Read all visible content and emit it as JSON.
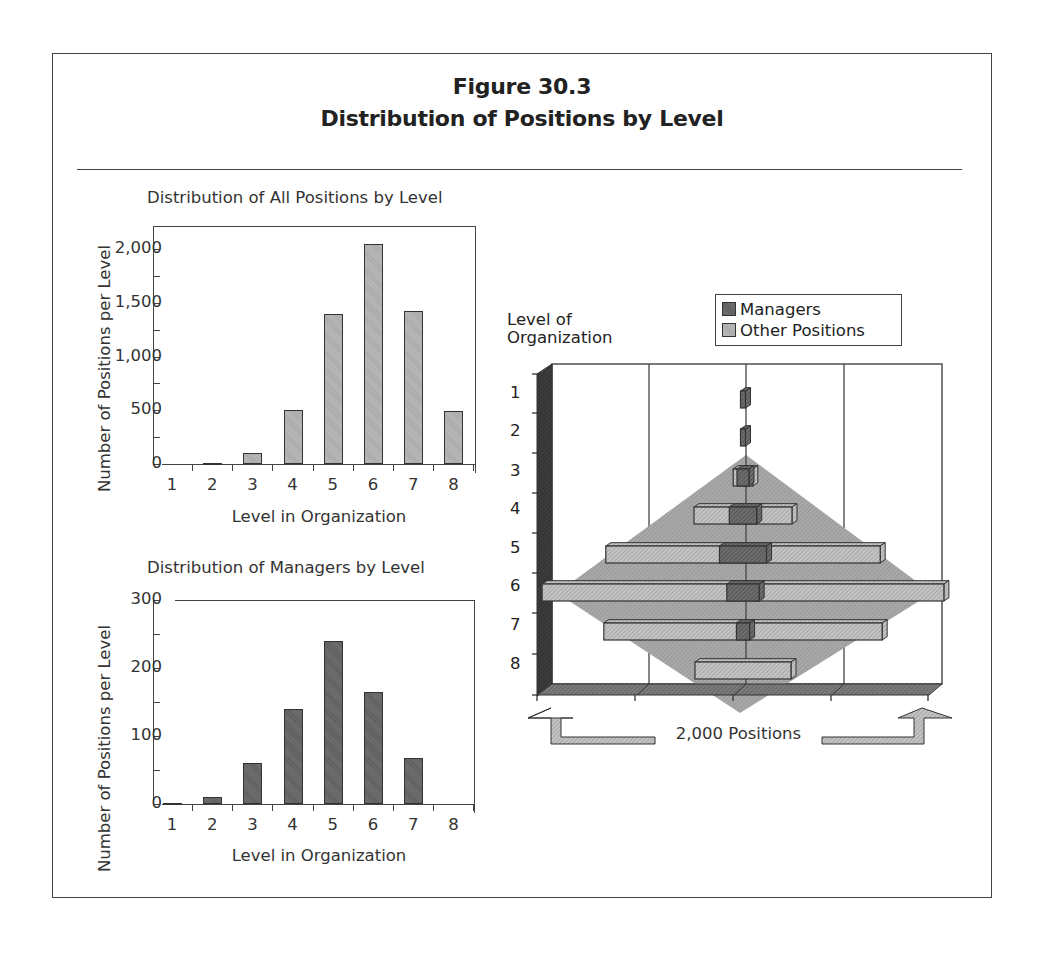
{
  "figure": {
    "number": "Figure 30.3",
    "title": "Distribution of Positions by Level"
  },
  "chart_data": [
    {
      "type": "bar",
      "title": "Distribution of All Positions by Level",
      "xlabel": "Level in Organization",
      "ylabel": "Number of Positions per Level",
      "categories": [
        "1",
        "2",
        "3",
        "4",
        "5",
        "6",
        "7",
        "8"
      ],
      "values": [
        0,
        10,
        100,
        500,
        1400,
        2050,
        1420,
        490
      ],
      "yticks": [
        "0",
        "500",
        "1,000",
        "1,500",
        "2,000"
      ],
      "ylim": [
        0,
        2200
      ],
      "grid": false,
      "color": "#b0b0b0"
    },
    {
      "type": "bar",
      "title": "Distribution of Managers by Level",
      "xlabel": "Level in Organization",
      "ylabel": "Number of Positions per Level",
      "categories": [
        "1",
        "2",
        "3",
        "4",
        "5",
        "6",
        "7",
        "8"
      ],
      "values": [
        1,
        11,
        60,
        140,
        240,
        165,
        67,
        0
      ],
      "yticks": [
        "0",
        "100",
        "200",
        "300"
      ],
      "ylim": [
        0,
        300
      ],
      "grid": false,
      "color": "#666666"
    },
    {
      "type": "bar",
      "subtype": "horizontal-stacked-pyramid-3d",
      "title": "",
      "ylabel": "Level of Organization",
      "xlabel": "2,000 Positions",
      "categories": [
        "1",
        "2",
        "3",
        "4",
        "5",
        "6",
        "7",
        "8"
      ],
      "series": [
        {
          "name": "Managers",
          "values": [
            1,
            11,
            60,
            140,
            240,
            165,
            67,
            0
          ],
          "color": "#666666"
        },
        {
          "name": "Other Positions",
          "values": [
            0,
            0,
            40,
            360,
            1160,
            1885,
            1353,
            490
          ],
          "color": "#c0c0c0"
        }
      ],
      "legend": {
        "position": "top-right",
        "entries": [
          "Managers",
          "Other Positions"
        ]
      },
      "grid": true,
      "annotation": "Shaded diamond indicates idealized pyramid distribution"
    }
  ],
  "labels": {
    "all_title": "Distribution of All Positions by Level",
    "mgr_title": "Distribution of Managers by Level",
    "ylabel": "Number of Positions per Level",
    "xlabel": "Level in Organization",
    "right_ylabel_line1": "Level of",
    "right_ylabel_line2": "Organization",
    "right_xlabel": "2,000 Positions",
    "legend_managers": "Managers",
    "legend_other": "Other Positions"
  },
  "colors": {
    "frame": "#444444",
    "light_bar": "#b0b0b0",
    "dark_bar": "#666666",
    "diamond": "#a8a8a8",
    "floor": "#7a7a7a",
    "wall_side": "#3a3a3a"
  }
}
